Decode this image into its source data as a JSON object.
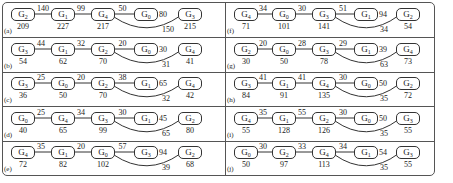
{
  "figure": {
    "panels": [
      {
        "label": "(a)",
        "nodes": [
          {
            "name": "G",
            "sub": "2",
            "cost": "209"
          },
          {
            "name": "G",
            "sub": "1",
            "cost": "227"
          },
          {
            "name": "G",
            "sub": "4",
            "cost": "217"
          },
          {
            "name": "G",
            "sub": "0",
            "cost": ""
          },
          {
            "name": "G",
            "sub": "3",
            "cost": "215"
          }
        ],
        "edges": [
          "140",
          "99",
          "50"
        ],
        "side_weight": "80",
        "curve_weight": "150"
      },
      {
        "label": "(b)",
        "nodes": [
          {
            "name": "G",
            "sub": "3",
            "cost": "54"
          },
          {
            "name": "G",
            "sub": "1",
            "cost": "62"
          },
          {
            "name": "G",
            "sub": "2",
            "cost": "70"
          },
          {
            "name": "G",
            "sub": "0",
            "cost": ""
          },
          {
            "name": "G",
            "sub": "4",
            "cost": "41"
          }
        ],
        "edges": [
          "44",
          "32",
          "20"
        ],
        "side_weight": "30",
        "curve_weight": "31"
      },
      {
        "label": "(c)",
        "nodes": [
          {
            "name": "G",
            "sub": "3",
            "cost": "36"
          },
          {
            "name": "G",
            "sub": "0",
            "cost": "50"
          },
          {
            "name": "G",
            "sub": "2",
            "cost": "70"
          },
          {
            "name": "G",
            "sub": "1",
            "cost": ""
          },
          {
            "name": "G",
            "sub": "4",
            "cost": "42"
          }
        ],
        "edges": [
          "25",
          "20",
          "38"
        ],
        "side_weight": "65",
        "curve_weight": "32"
      },
      {
        "label": "(d)",
        "nodes": [
          {
            "name": "G",
            "sub": "0",
            "cost": "40"
          },
          {
            "name": "G",
            "sub": "4",
            "cost": "65"
          },
          {
            "name": "G",
            "sub": "3",
            "cost": "99"
          },
          {
            "name": "G",
            "sub": "1",
            "cost": ""
          },
          {
            "name": "G",
            "sub": "2",
            "cost": "80"
          }
        ],
        "edges": [
          "25",
          "34",
          "30"
        ],
        "side_weight": "45",
        "curve_weight": "65"
      },
      {
        "label": "(e)",
        "nodes": [
          {
            "name": "G",
            "sub": "4",
            "cost": "72"
          },
          {
            "name": "G",
            "sub": "1",
            "cost": "82"
          },
          {
            "name": "G",
            "sub": "0",
            "cost": "102"
          },
          {
            "name": "G",
            "sub": "3",
            "cost": ""
          },
          {
            "name": "G",
            "sub": "2",
            "cost": "68"
          }
        ],
        "edges": [
          "35",
          "20",
          "57"
        ],
        "side_weight": "94",
        "curve_weight": "39"
      },
      {
        "label": "(f)",
        "nodes": [
          {
            "name": "G",
            "sub": "4",
            "cost": "71"
          },
          {
            "name": "G",
            "sub": "0",
            "cost": "101"
          },
          {
            "name": "G",
            "sub": "3",
            "cost": "141"
          },
          {
            "name": "G",
            "sub": "1",
            "cost": ""
          },
          {
            "name": "G",
            "sub": "2",
            "cost": "54"
          }
        ],
        "edges": [
          "34",
          "30",
          "51"
        ],
        "side_weight": "94",
        "curve_weight": "34"
      },
      {
        "label": "(g)",
        "nodes": [
          {
            "name": "G",
            "sub": "2",
            "cost": "30"
          },
          {
            "name": "G",
            "sub": "0",
            "cost": "50"
          },
          {
            "name": "G",
            "sub": "3",
            "cost": "78"
          },
          {
            "name": "G",
            "sub": "1",
            "cost": ""
          },
          {
            "name": "G",
            "sub": "4",
            "cost": "73"
          }
        ],
        "edges": [
          "20",
          "28",
          "29"
        ],
        "side_weight": "39",
        "curve_weight": "63"
      },
      {
        "label": "(h)",
        "nodes": [
          {
            "name": "G",
            "sub": "3",
            "cost": "84"
          },
          {
            "name": "G",
            "sub": "1",
            "cost": "91"
          },
          {
            "name": "G",
            "sub": "4",
            "cost": "135"
          },
          {
            "name": "G",
            "sub": "0",
            "cost": ""
          },
          {
            "name": "G",
            "sub": "2",
            "cost": "72"
          }
        ],
        "edges": [
          "41",
          "41",
          "30"
        ],
        "side_weight": "50",
        "curve_weight": "35"
      },
      {
        "label": "(i)",
        "nodes": [
          {
            "name": "G",
            "sub": "4",
            "cost": "55"
          },
          {
            "name": "G",
            "sub": "1",
            "cost": "128"
          },
          {
            "name": "G",
            "sub": "2",
            "cost": "126"
          },
          {
            "name": "G",
            "sub": "0",
            "cost": ""
          },
          {
            "name": "G",
            "sub": "3",
            "cost": "55"
          }
        ],
        "edges": [
          "35",
          "55",
          "30"
        ],
        "side_weight": "50",
        "curve_weight": "35"
      },
      {
        "label": "(j)",
        "nodes": [
          {
            "name": "G",
            "sub": "0",
            "cost": "50"
          },
          {
            "name": "G",
            "sub": "2",
            "cost": "97"
          },
          {
            "name": "G",
            "sub": "4",
            "cost": "113"
          },
          {
            "name": "G",
            "sub": "1",
            "cost": ""
          },
          {
            "name": "G",
            "sub": "3",
            "cost": "55"
          }
        ],
        "edges": [
          "30",
          "33",
          "34"
        ],
        "side_weight": "54",
        "curve_weight": "35"
      }
    ]
  }
}
